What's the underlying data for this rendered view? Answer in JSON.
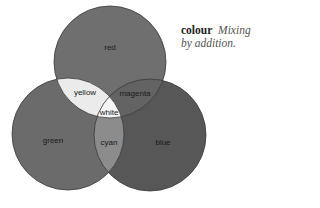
{
  "caption": {
    "term": "colour",
    "description_line1": "Mixing",
    "description_line2": "by addition."
  },
  "diagram": {
    "type": "venn",
    "circles": [
      {
        "name": "red",
        "label": "red",
        "cx": 110,
        "cy": 62,
        "r": 56,
        "fill": "#6f6f6f"
      },
      {
        "name": "green",
        "label": "green",
        "cx": 68,
        "cy": 134,
        "r": 56,
        "fill": "#6b6b6b"
      },
      {
        "name": "blue",
        "label": "blue",
        "cx": 150,
        "cy": 135,
        "r": 56,
        "fill": "#575757"
      }
    ],
    "overlaps": {
      "yellow": {
        "label": "yellow",
        "fill": "#ebebeb"
      },
      "magenta": {
        "label": "magenta",
        "fill": "#636363"
      },
      "cyan": {
        "label": "cyan",
        "fill": "#8c8c8c"
      },
      "white": {
        "label": "white",
        "fill": "#f5f5f5"
      }
    },
    "outline_color": "#3a3a3a"
  }
}
